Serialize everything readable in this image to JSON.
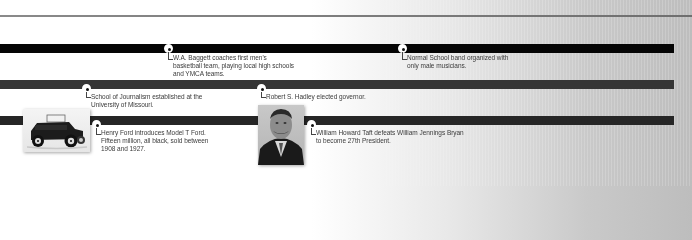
{
  "timeline": {
    "tracks": [
      {
        "id": "track-1",
        "color": "#050505"
      },
      {
        "id": "track-2",
        "color": "#353535"
      },
      {
        "id": "track-3",
        "color": "#262626"
      }
    ],
    "events": [
      {
        "track": 1,
        "text": "W.A. Baggett coaches first men's basketball team, playing local high schools and YMCA teams."
      },
      {
        "track": 1,
        "text": "Normal School band organized with only male musicians."
      },
      {
        "track": 2,
        "text": "School of Journalism established at the University of Missouri."
      },
      {
        "track": 2,
        "text": "Robert S. Hadley elected governor."
      },
      {
        "track": 3,
        "text": "Henry Ford introduces Model T Ford. Fifteen million, all black, sold between 1908 and 1927."
      },
      {
        "track": 3,
        "text": "William Howard Taft defeats William Jennings Bryan to become 27th President."
      }
    ],
    "photos": [
      {
        "subject": "Model T Ford automobile"
      },
      {
        "subject": "William Howard Taft portrait"
      }
    ]
  }
}
